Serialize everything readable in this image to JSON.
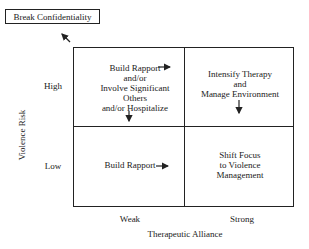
{
  "diagram": {
    "escalation_box": {
      "label": "Break Confidentiality"
    },
    "y_axis": {
      "title": "Violence Risk",
      "ticks": [
        "High",
        "Low"
      ]
    },
    "x_axis": {
      "title": "Therapeutic Alliance",
      "ticks": [
        "Weak",
        "Strong"
      ]
    },
    "quadrants": {
      "high_weak": {
        "lines": [
          "Build Rapport",
          "and/or",
          "Involve Significant",
          "Others",
          "and/or Hospitalize"
        ],
        "arrows": [
          "right",
          "down",
          "up-left to Break Confidentiality"
        ]
      },
      "high_strong": {
        "lines": [
          "Intensify Therapy",
          "and",
          "Manage Environment"
        ],
        "arrows": [
          "down"
        ]
      },
      "low_weak": {
        "lines": [
          "Build Rapport"
        ],
        "arrows": [
          "right"
        ]
      },
      "low_strong": {
        "lines": [
          "Shift Focus",
          "to Violence",
          "Management"
        ],
        "arrows": []
      }
    },
    "colors": {
      "line": "#222222",
      "background": "#ffffff"
    }
  }
}
